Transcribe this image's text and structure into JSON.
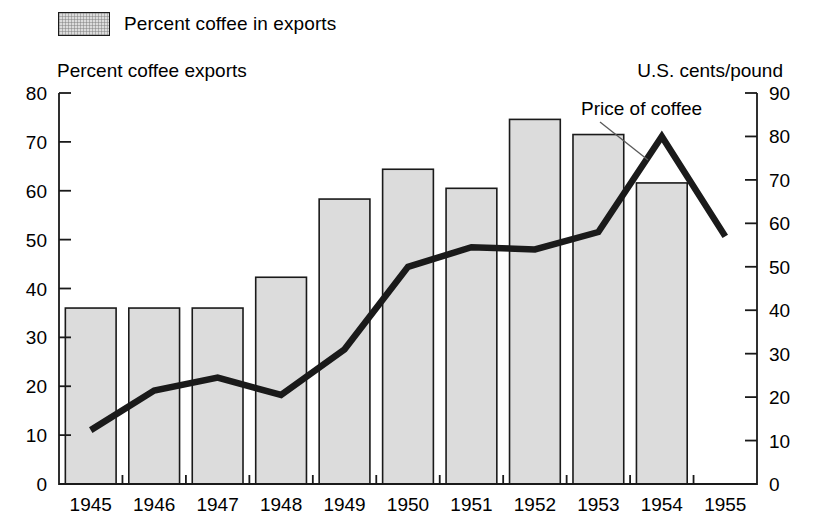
{
  "legend": {
    "swatch_name": "bar-swatch",
    "label": "Percent coffee in exports"
  },
  "annotations": {
    "left_axis_title": "Percent coffee exports",
    "right_axis_title": "U.S. cents/pound",
    "line_series_label": "Price of coffee"
  },
  "chart_data": {
    "type": "bar",
    "title": "",
    "subtitle": "",
    "xlabel": "",
    "ylabel": "Percent coffee exports",
    "y2label": "U.S. cents/pound",
    "grid": false,
    "legend_position": "top-left",
    "categories": [
      "1945",
      "1946",
      "1947",
      "1948",
      "1949",
      "1950",
      "1951",
      "1952",
      "1953",
      "1954",
      "1955"
    ],
    "ylim": [
      0,
      80
    ],
    "y2lim": [
      0,
      90
    ],
    "yticks": [
      0,
      10,
      20,
      30,
      40,
      50,
      60,
      70,
      80
    ],
    "y2ticks": [
      0,
      10,
      20,
      30,
      40,
      50,
      60,
      70,
      80,
      90
    ],
    "series": [
      {
        "name": "Percent coffee in exports",
        "type": "bar",
        "axis": "left",
        "units": "percent",
        "values": [
          36.0,
          36.0,
          36.0,
          42.3,
          58.3,
          64.4,
          60.5,
          74.6,
          71.5,
          61.6,
          null
        ]
      },
      {
        "name": "Price of coffee",
        "type": "line",
        "axis": "right",
        "units": "U.S. cents/pound",
        "values": [
          12.4,
          21.5,
          24.5,
          20.5,
          31.0,
          50.0,
          54.5,
          54.0,
          58.0,
          80.0,
          57.0
        ]
      }
    ]
  }
}
